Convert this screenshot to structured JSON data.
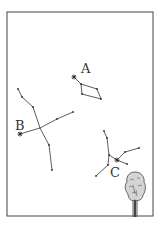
{
  "figure": {
    "frame": {
      "x": 7,
      "y": 12,
      "w": 146,
      "h": 204,
      "stroke": "#444444"
    },
    "constellations": [
      {
        "label": "A",
        "label_pos": [
          83,
          74
        ],
        "star": [
          74,
          77
        ],
        "points": [
          [
            74,
            77
          ],
          [
            81,
            84
          ],
          [
            97,
            89
          ],
          [
            101,
            99
          ],
          [
            82,
            94
          ],
          [
            81,
            84
          ]
        ]
      },
      {
        "label": "B",
        "label_pos": [
          16,
          130
        ],
        "star": [
          20,
          134
        ],
        "branches": [
          [
            [
              18,
              89
            ],
            [
              22,
              97
            ],
            [
              33,
              107
            ],
            [
              40,
              128
            ],
            [
              49,
              145
            ],
            [
              52,
              170
            ]
          ],
          [
            [
              20,
              134
            ],
            [
              40,
              128
            ],
            [
              57,
              119
            ],
            [
              73,
              112
            ]
          ]
        ]
      },
      {
        "label": "C",
        "label_pos": [
          110,
          176
        ],
        "star": [
          117,
          160
        ],
        "branches": [
          [
            [
              104,
              131
            ],
            [
              107,
              138
            ],
            [
              109,
              155
            ],
            [
              108,
              165
            ],
            [
              96,
              176
            ]
          ],
          [
            [
              109,
              155
            ],
            [
              117,
              160
            ],
            [
              127,
              164
            ]
          ],
          [
            [
              117,
              160
            ],
            [
              125,
              152
            ],
            [
              139,
              148
            ]
          ]
        ]
      }
    ],
    "tree": {
      "label": "tree-icon",
      "canopy_color": "#cfcfcf",
      "trunk_color": "#333333"
    }
  }
}
